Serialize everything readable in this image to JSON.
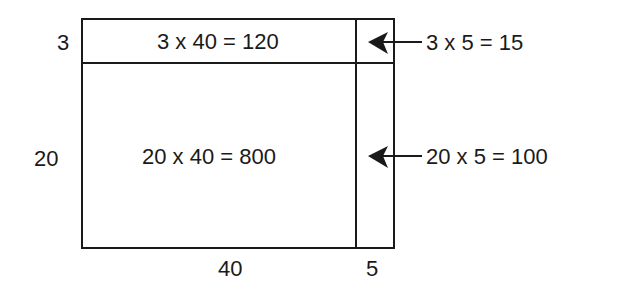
{
  "diagram": {
    "side_labels": {
      "top_row_height": "3",
      "bottom_row_height": "20",
      "left_col_width": "40",
      "right_col_width": "5"
    },
    "cells": {
      "top_left": "3 x 40 = 120",
      "bottom_left": "20 x 40 = 800"
    },
    "callouts": {
      "top_right": "3 x 5 = 15",
      "bottom_right": "20 x 5 = 100"
    },
    "colors": {
      "stroke": "#1a1a1a",
      "background": "#ffffff"
    }
  }
}
